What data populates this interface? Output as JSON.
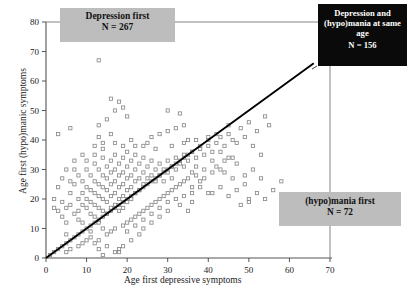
{
  "chart_data": {
    "type": "scatter",
    "title": "",
    "xlabel": "Age first depressive symptoms",
    "ylabel": "Age first (hypo)manic symptoms",
    "xlim": [
      0,
      70
    ],
    "ylim": [
      0,
      80
    ],
    "xticks": [
      0,
      10,
      20,
      30,
      40,
      50,
      60,
      70
    ],
    "yticks": [
      0,
      10,
      20,
      30,
      40,
      50,
      60,
      70,
      80
    ],
    "grid": false,
    "legend": "none",
    "reference_line": {
      "type": "identity",
      "from": [
        0,
        0
      ],
      "to": [
        66,
        66
      ],
      "color": "#000000"
    },
    "marker": {
      "shape": "open-square",
      "size": 3.2,
      "color": "#8a8a8a"
    },
    "annotations": [
      {
        "name": "depression-first",
        "text": "Depression first",
        "n_label": "N = 267",
        "n": 267,
        "style": "gray-box",
        "region": "above-diagonal"
      },
      {
        "name": "same-age",
        "text": "Depression and (hypo)mania at same age",
        "n_label": "N = 156",
        "n": 156,
        "style": "black-box",
        "region": "on-diagonal"
      },
      {
        "name": "hypomania-first",
        "text": "(hypo)mania first",
        "n_label": "N = 72",
        "n": 72,
        "style": "gray-box",
        "region": "below-diagonal"
      }
    ],
    "points": [
      [
        3,
        42
      ],
      [
        6,
        44
      ],
      [
        13,
        67
      ],
      [
        13,
        45
      ],
      [
        13,
        41
      ],
      [
        15,
        47
      ],
      [
        16,
        54
      ],
      [
        17,
        50
      ],
      [
        18,
        53
      ],
      [
        19,
        51
      ],
      [
        20,
        48
      ],
      [
        26,
        41
      ],
      [
        28,
        42
      ],
      [
        30,
        43
      ],
      [
        30,
        50
      ],
      [
        32,
        44
      ],
      [
        33,
        49
      ],
      [
        34,
        45
      ],
      [
        35,
        40
      ],
      [
        25,
        39
      ],
      [
        22,
        38
      ],
      [
        19,
        38
      ],
      [
        17,
        39
      ],
      [
        14,
        37
      ],
      [
        12,
        38
      ],
      [
        9,
        35
      ],
      [
        7,
        33
      ],
      [
        5,
        30
      ],
      [
        4,
        27
      ],
      [
        3,
        24
      ],
      [
        2,
        20
      ],
      [
        2,
        17
      ],
      [
        3,
        16
      ],
      [
        4,
        14
      ],
      [
        5,
        12
      ],
      [
        5,
        8
      ],
      [
        6,
        18
      ],
      [
        6,
        22
      ],
      [
        7,
        25
      ],
      [
        7,
        30
      ],
      [
        8,
        20
      ],
      [
        8,
        16
      ],
      [
        8,
        13
      ],
      [
        9,
        26
      ],
      [
        9,
        22
      ],
      [
        9,
        18
      ],
      [
        10,
        30
      ],
      [
        10,
        24
      ],
      [
        10,
        20
      ],
      [
        10,
        17
      ],
      [
        11,
        28
      ],
      [
        11,
        23
      ],
      [
        11,
        19
      ],
      [
        11,
        15
      ],
      [
        12,
        32
      ],
      [
        12,
        26
      ],
      [
        12,
        22
      ],
      [
        12,
        18
      ],
      [
        12,
        14
      ],
      [
        13,
        30
      ],
      [
        13,
        25
      ],
      [
        13,
        21
      ],
      [
        13,
        17
      ],
      [
        13,
        12
      ],
      [
        14,
        34
      ],
      [
        14,
        28
      ],
      [
        14,
        24
      ],
      [
        14,
        20
      ],
      [
        14,
        16
      ],
      [
        14,
        10
      ],
      [
        15,
        31
      ],
      [
        15,
        27
      ],
      [
        15,
        23
      ],
      [
        15,
        19
      ],
      [
        15,
        15
      ],
      [
        16,
        33
      ],
      [
        16,
        29
      ],
      [
        16,
        25
      ],
      [
        16,
        21
      ],
      [
        16,
        17
      ],
      [
        17,
        35
      ],
      [
        17,
        30
      ],
      [
        17,
        26
      ],
      [
        17,
        22
      ],
      [
        17,
        18
      ],
      [
        18,
        32
      ],
      [
        18,
        28
      ],
      [
        18,
        24
      ],
      [
        18,
        20
      ],
      [
        18,
        16
      ],
      [
        19,
        34
      ],
      [
        19,
        29
      ],
      [
        19,
        25
      ],
      [
        19,
        21
      ],
      [
        19,
        17
      ],
      [
        20,
        36
      ],
      [
        20,
        31
      ],
      [
        20,
        27
      ],
      [
        20,
        23
      ],
      [
        20,
        19
      ],
      [
        21,
        33
      ],
      [
        21,
        28
      ],
      [
        21,
        24
      ],
      [
        21,
        20
      ],
      [
        22,
        35
      ],
      [
        22,
        30
      ],
      [
        22,
        26
      ],
      [
        22,
        22
      ],
      [
        23,
        32
      ],
      [
        23,
        27
      ],
      [
        23,
        23
      ],
      [
        24,
        34
      ],
      [
        24,
        29
      ],
      [
        24,
        25
      ],
      [
        25,
        31
      ],
      [
        25,
        27
      ],
      [
        26,
        33
      ],
      [
        26,
        28
      ],
      [
        27,
        30
      ],
      [
        27,
        26
      ],
      [
        28,
        32
      ],
      [
        28,
        28
      ],
      [
        29,
        30
      ],
      [
        29,
        26
      ],
      [
        30,
        33
      ],
      [
        30,
        29
      ],
      [
        31,
        31
      ],
      [
        31,
        27
      ],
      [
        32,
        34
      ],
      [
        32,
        30
      ],
      [
        33,
        32
      ],
      [
        34,
        35
      ],
      [
        34,
        31
      ],
      [
        35,
        33
      ],
      [
        36,
        36
      ],
      [
        37,
        34
      ],
      [
        38,
        37
      ],
      [
        39,
        35
      ],
      [
        40,
        38
      ],
      [
        41,
        36
      ],
      [
        42,
        39
      ],
      [
        43,
        41
      ],
      [
        44,
        38
      ],
      [
        45,
        42
      ],
      [
        46,
        40
      ],
      [
        48,
        44
      ],
      [
        50,
        46
      ],
      [
        52,
        43
      ],
      [
        54,
        48
      ],
      [
        55,
        45
      ],
      [
        1,
        1
      ],
      [
        2,
        2
      ],
      [
        3,
        3
      ],
      [
        4,
        4
      ],
      [
        5,
        5
      ],
      [
        6,
        6
      ],
      [
        7,
        7
      ],
      [
        8,
        8
      ],
      [
        9,
        9
      ],
      [
        10,
        10
      ],
      [
        11,
        11
      ],
      [
        12,
        12
      ],
      [
        13,
        13
      ],
      [
        14,
        14
      ],
      [
        15,
        15
      ],
      [
        16,
        16
      ],
      [
        17,
        17
      ],
      [
        18,
        18
      ],
      [
        19,
        19
      ],
      [
        20,
        20
      ],
      [
        21,
        21
      ],
      [
        22,
        22
      ],
      [
        23,
        23
      ],
      [
        24,
        24
      ],
      [
        25,
        25
      ],
      [
        26,
        26
      ],
      [
        27,
        27
      ],
      [
        28,
        28
      ],
      [
        29,
        29
      ],
      [
        30,
        30
      ],
      [
        31,
        31
      ],
      [
        32,
        32
      ],
      [
        33,
        33
      ],
      [
        34,
        34
      ],
      [
        35,
        35
      ],
      [
        36,
        36
      ],
      [
        38,
        38
      ],
      [
        40,
        40
      ],
      [
        42,
        42
      ],
      [
        45,
        45
      ],
      [
        5,
        2
      ],
      [
        6,
        3
      ],
      [
        8,
        4
      ],
      [
        9,
        5
      ],
      [
        10,
        6
      ],
      [
        11,
        7
      ],
      [
        12,
        5
      ],
      [
        13,
        3
      ],
      [
        14,
        1
      ],
      [
        18,
        2
      ],
      [
        18,
        3
      ],
      [
        15,
        8
      ],
      [
        16,
        9
      ],
      [
        17,
        10
      ],
      [
        19,
        11
      ],
      [
        20,
        12
      ],
      [
        21,
        13
      ],
      [
        22,
        14
      ],
      [
        23,
        15
      ],
      [
        24,
        16
      ],
      [
        25,
        17
      ],
      [
        26,
        18
      ],
      [
        27,
        19
      ],
      [
        28,
        20
      ],
      [
        29,
        21
      ],
      [
        30,
        22
      ],
      [
        31,
        23
      ],
      [
        32,
        24
      ],
      [
        33,
        25
      ],
      [
        34,
        26
      ],
      [
        35,
        27
      ],
      [
        36,
        24
      ],
      [
        37,
        28
      ],
      [
        38,
        26
      ],
      [
        39,
        30
      ],
      [
        40,
        22
      ],
      [
        41,
        29
      ],
      [
        42,
        31
      ],
      [
        44,
        33
      ],
      [
        46,
        34
      ],
      [
        48,
        18
      ],
      [
        50,
        20
      ],
      [
        50,
        19
      ],
      [
        35,
        16
      ],
      [
        36,
        22
      ],
      [
        33,
        18
      ],
      [
        30,
        16
      ],
      [
        28,
        14
      ],
      [
        26,
        12
      ],
      [
        24,
        10
      ],
      [
        23,
        8
      ],
      [
        21,
        6
      ],
      [
        19,
        4
      ],
      [
        17,
        2
      ],
      [
        15,
        4
      ],
      [
        13,
        6
      ],
      [
        11,
        9
      ],
      [
        9,
        12
      ],
      [
        7,
        15
      ],
      [
        5,
        17
      ],
      [
        4,
        19
      ],
      [
        6,
        26
      ],
      [
        8,
        28
      ],
      [
        10,
        33
      ],
      [
        12,
        35
      ],
      [
        14,
        39
      ],
      [
        16,
        42
      ],
      [
        21,
        40
      ],
      [
        24,
        38
      ],
      [
        27,
        37
      ],
      [
        31,
        38
      ],
      [
        34,
        39
      ],
      [
        37,
        40
      ],
      [
        40,
        41
      ],
      [
        43,
        36
      ],
      [
        47,
        39
      ],
      [
        49,
        41
      ],
      [
        51,
        38
      ],
      [
        53,
        35
      ],
      [
        44,
        29
      ],
      [
        46,
        27
      ],
      [
        49,
        25
      ],
      [
        52,
        22
      ],
      [
        54,
        20
      ],
      [
        56,
        23
      ],
      [
        58,
        26
      ],
      [
        47,
        32
      ],
      [
        45,
        34
      ],
      [
        43,
        30
      ],
      [
        41,
        33
      ],
      [
        39,
        27
      ],
      [
        37,
        31
      ],
      [
        36,
        29
      ],
      [
        38,
        24
      ],
      [
        41,
        22
      ],
      [
        43,
        24
      ],
      [
        45,
        21
      ],
      [
        47,
        23
      ],
      [
        49,
        28
      ],
      [
        51,
        30
      ],
      [
        53,
        27
      ],
      [
        36,
        19
      ],
      [
        34,
        21
      ],
      [
        32,
        20
      ],
      [
        30,
        19
      ],
      [
        28,
        17
      ],
      [
        26,
        15
      ],
      [
        24,
        13
      ],
      [
        22,
        11
      ],
      [
        20,
        9
      ]
    ]
  }
}
